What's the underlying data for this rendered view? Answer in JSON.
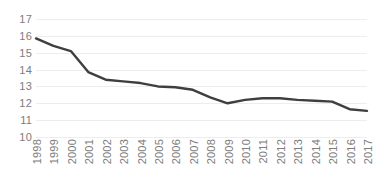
{
  "chart_data": {
    "type": "line",
    "title": "",
    "subtitle": "",
    "xlabel": "",
    "ylabel": "",
    "categories": [
      "1998",
      "1999",
      "2000",
      "2001",
      "2002",
      "2003",
      "2004",
      "2005",
      "2006",
      "2007",
      "2008",
      "2009",
      "2010",
      "2011",
      "2012",
      "2013",
      "2014",
      "2015",
      "2016",
      "2017"
    ],
    "values": [
      15.85,
      15.4,
      15.1,
      13.85,
      13.4,
      13.3,
      13.2,
      13.0,
      12.95,
      12.8,
      12.35,
      12.0,
      12.2,
      12.3,
      12.3,
      12.2,
      12.15,
      12.1,
      11.65,
      11.55
    ],
    "series": [
      {
        "name": "series-1",
        "values": [
          15.85,
          15.4,
          15.1,
          13.85,
          13.4,
          13.3,
          13.2,
          13.0,
          12.95,
          12.8,
          12.35,
          12.0,
          12.2,
          12.3,
          12.3,
          12.2,
          12.15,
          12.1,
          11.65,
          11.55
        ]
      }
    ],
    "ylim": [
      10,
      17
    ],
    "xlim_categories": [
      "1998",
      "2017"
    ],
    "y_ticks": [
      10,
      11,
      12,
      13,
      14,
      15,
      16,
      17
    ],
    "y_tick_labels": [
      "10",
      "11",
      "12",
      "13",
      "14",
      "15",
      "16",
      "17"
    ],
    "x_tick_labels": [
      "1998",
      "1999",
      "2000",
      "2001",
      "2002",
      "2003",
      "2004",
      "2005",
      "2006",
      "2007",
      "2008",
      "2009",
      "2010",
      "2011",
      "2012",
      "2013",
      "2014",
      "2015",
      "2016",
      "2017"
    ],
    "grid": true,
    "grid_axis": "y",
    "legend": false,
    "legend_position": "none",
    "annotations": [],
    "colors": {
      "line": "#3f3f3f",
      "grid": "#ededed",
      "tick_label": "#7c7c7c",
      "background": "#ffffff"
    },
    "line_width": 2.4,
    "markers": false,
    "x_tick_label_rotation": -90
  }
}
